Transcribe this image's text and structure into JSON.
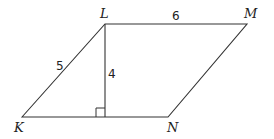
{
  "diagram": {
    "type": "parallelogram",
    "vertices": {
      "K": {
        "label": "K",
        "x": 22,
        "y": 117
      },
      "L": {
        "label": "L",
        "x": 105,
        "y": 24
      },
      "M": {
        "label": "M",
        "x": 247,
        "y": 24
      },
      "N": {
        "label": "N",
        "x": 168,
        "y": 117
      }
    },
    "measures": {
      "KL": "5",
      "LM": "6",
      "height": "4"
    },
    "right_angle_marker": true,
    "colors": {
      "stroke": "#333333",
      "text": "#222222",
      "background": "#ffffff"
    }
  }
}
